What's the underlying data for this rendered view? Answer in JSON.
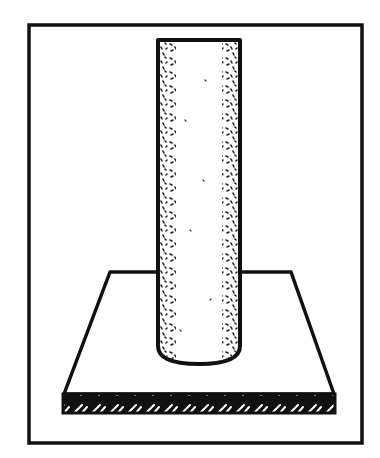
{
  "illustration": {
    "subject": "cylinder-on-base-plate",
    "description": "Hand-drawn ink sketch of a vertical cylindrical rod standing upright on a flat square base plate, enclosed in a rectangular frame",
    "colors": {
      "ink": "#111111",
      "background": "#ffffff",
      "stipple": "#222222"
    },
    "frame": {
      "x": 28,
      "y": 24,
      "width": 335,
      "height": 420
    },
    "cylinder": {
      "left": 157,
      "right": 240,
      "top": 40,
      "bottom": 363
    },
    "plate": {
      "back_left": [
        110,
        272
      ],
      "back_right": [
        291,
        272
      ],
      "front_left": [
        64,
        394
      ],
      "front_right": [
        334,
        394
      ],
      "thickness": 19
    }
  }
}
